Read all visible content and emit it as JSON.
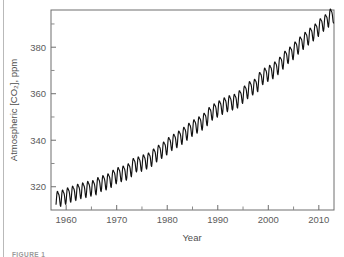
{
  "figure": {
    "caption_label": "FIGURE 1"
  },
  "chart_data": {
    "type": "line",
    "title": "",
    "xlabel": "Year",
    "ylabel": "Atmospheric [CO2], ppm",
    "ylabel_display": "Atmospheric [CO₂], ppm",
    "xlim": [
      1957.0,
      2013.0
    ],
    "ylim": [
      310.0,
      396.0
    ],
    "grid": false,
    "legend": null,
    "series_color": "#111111",
    "x_ticks_major": [
      1960,
      1970,
      1980,
      1990,
      2000,
      2010
    ],
    "x_tick_labels": [
      "1960",
      "1970",
      "1980",
      "1990",
      "2000",
      "2010"
    ],
    "x_ticks_minor": [
      1965,
      1975,
      1985,
      1995,
      2005
    ],
    "y_ticks_major": [
      320,
      340,
      360,
      380
    ],
    "y_tick_labels": [
      "320",
      "340",
      "360",
      "380"
    ],
    "y_ticks_minor": [
      330,
      350,
      370,
      390
    ],
    "seasonal_amplitude_ppm": 3.1,
    "annual_mean_series": {
      "name": "Annual mean CO2",
      "x": [
        1958,
        1959,
        1960,
        1961,
        1962,
        1963,
        1964,
        1965,
        1966,
        1967,
        1968,
        1969,
        1970,
        1971,
        1972,
        1973,
        1974,
        1975,
        1976,
        1977,
        1978,
        1979,
        1980,
        1981,
        1982,
        1983,
        1984,
        1985,
        1986,
        1987,
        1988,
        1989,
        1990,
        1991,
        1992,
        1993,
        1994,
        1995,
        1996,
        1997,
        1998,
        1999,
        2000,
        2001,
        2002,
        2003,
        2004,
        2005,
        2006,
        2007,
        2008,
        2009,
        2010,
        2011,
        2012
      ],
      "values": [
        315.3,
        315.98,
        316.91,
        317.64,
        318.45,
        318.99,
        319.62,
        320.04,
        321.37,
        322.18,
        323.05,
        324.62,
        325.68,
        326.32,
        327.46,
        329.68,
        330.19,
        331.12,
        332.03,
        333.84,
        335.41,
        336.84,
        338.76,
        340.12,
        341.48,
        343.15,
        344.85,
        346.35,
        347.61,
        349.31,
        351.69,
        353.2,
        354.45,
        355.7,
        356.54,
        357.21,
        358.96,
        360.97,
        362.74,
        363.88,
        366.84,
        368.54,
        369.71,
        371.32,
        373.45,
        375.98,
        377.7,
        379.98,
        382.09,
        384.02,
        385.83,
        387.64,
        389.9,
        391.65,
        393.85
      ]
    }
  }
}
